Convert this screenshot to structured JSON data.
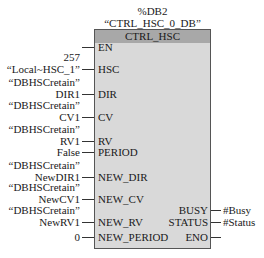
{
  "instance": {
    "db_number": "%DB2",
    "db_name": "“CTRL_HSC_0_DB”"
  },
  "block": {
    "type_name": "CTRL_HSC"
  },
  "inputs": [
    {
      "pin": "EN",
      "y": 47,
      "value_lines": []
    },
    {
      "pin": "HSC",
      "y": 69,
      "value_lines": [
        "257",
        "“Local~HSC_1”"
      ]
    },
    {
      "pin": "DIR",
      "y": 94,
      "value_lines": [
        "“DBHSCretain”",
        "DIR1"
      ]
    },
    {
      "pin": "CV",
      "y": 117,
      "value_lines": [
        "“DBHSCretain”",
        "CV1"
      ]
    },
    {
      "pin": "RV",
      "y": 141,
      "value_lines": [
        "“DBHSCretain”",
        "RV1"
      ]
    },
    {
      "pin": "PERIOD",
      "y": 152,
      "value_lines": [
        "False"
      ]
    },
    {
      "pin": "NEW_DIR",
      "y": 177,
      "value_lines": [
        "“DBHSCretain”",
        "NewDIR1"
      ]
    },
    {
      "pin": "NEW_CV",
      "y": 199,
      "value_lines": [
        "“DBHSCretain”",
        "NewCV1"
      ]
    },
    {
      "pin": "NEW_RV",
      "y": 222,
      "value_lines": [
        "“DBHSCretain”",
        "NewRV1"
      ]
    },
    {
      "pin": "NEW_PERIOD",
      "y": 237,
      "value_lines": [
        "0"
      ]
    }
  ],
  "outputs": [
    {
      "pin": "BUSY",
      "y": 210,
      "value": "#Busy"
    },
    {
      "pin": "STATUS",
      "y": 222,
      "value": "#Status"
    },
    {
      "pin": "ENO",
      "y": 237,
      "value": ""
    }
  ]
}
